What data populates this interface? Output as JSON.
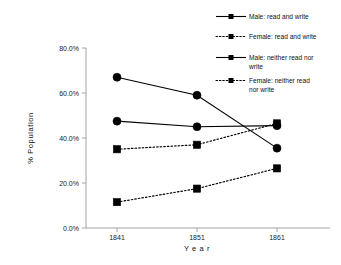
{
  "chart_data": {
    "type": "line",
    "title": "",
    "xlabel": "Year",
    "ylabel": "% Population",
    "categories": [
      "1841",
      "1851",
      "1861"
    ],
    "ylim": [
      0,
      80
    ],
    "ytick_values": [
      0,
      20,
      40,
      60,
      80
    ],
    "ytick_labels": [
      "0.0%",
      "20.0%",
      "40.0%",
      "60.0%",
      "80.0%"
    ],
    "grid": false,
    "legend_position": "top-right",
    "series": [
      {
        "name": "Male: read and write",
        "values": [
          47.5,
          45.0,
          45.5
        ],
        "line_style": "solid",
        "marker": "circle"
      },
      {
        "name": "Female: read and write",
        "values": [
          35.0,
          37.0,
          46.5
        ],
        "line_style": "dotted",
        "marker": "square"
      },
      {
        "name": "Male: neither read nor write",
        "values": [
          67.0,
          59.0,
          35.5
        ],
        "line_style": "solid",
        "marker": "circle"
      },
      {
        "name": "Female: neither read nor write",
        "values": [
          11.5,
          17.5,
          26.5
        ],
        "line_style": "dotted",
        "marker": "square"
      }
    ]
  },
  "legend": {
    "entries": [
      {
        "label": "Male: read and write"
      },
      {
        "label": "Female: read and write"
      },
      {
        "label": "Male: neither read nor",
        "label2": "write"
      },
      {
        "label": "Female: neither read",
        "label2": "nor write"
      }
    ]
  },
  "axes": {
    "y_title": "% Population",
    "x_title": "Y e a r",
    "y_ticks": [
      "80.0%",
      "60.0%",
      "40.0%",
      "20.0%",
      "0.0%"
    ],
    "x_ticks": [
      "1841",
      "1851",
      "1861"
    ]
  },
  "colors": {
    "ink": "#000000",
    "axis": "#9a9a9a",
    "background": "#ffffff"
  }
}
